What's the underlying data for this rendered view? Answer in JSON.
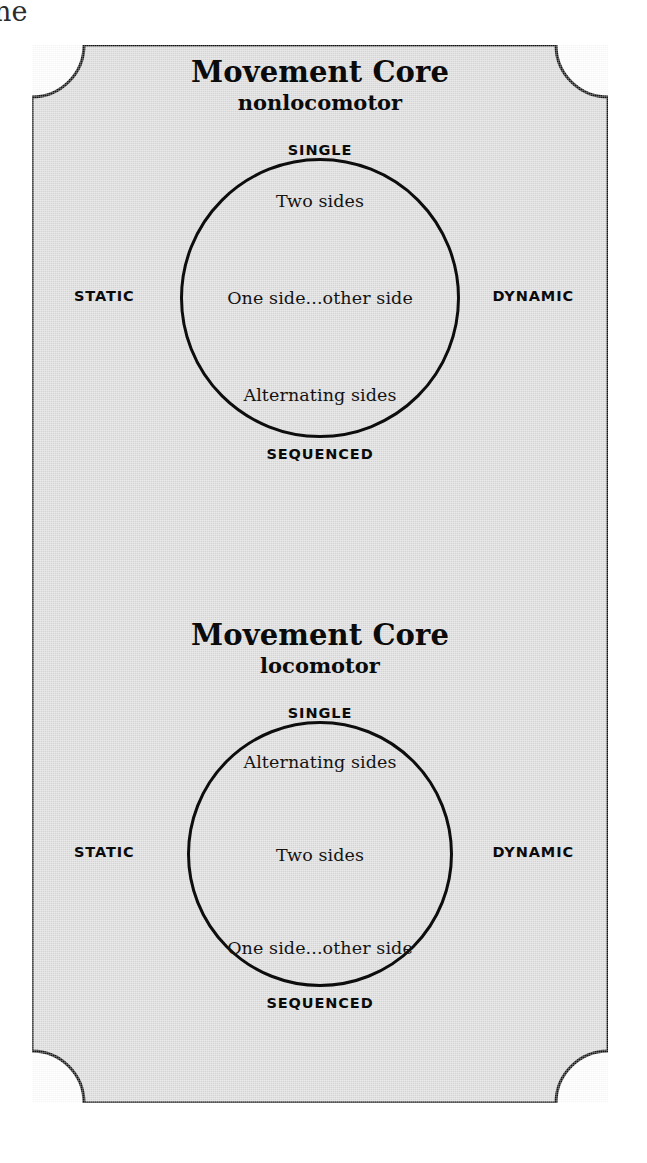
{
  "page": {
    "edge_text": "ne",
    "paper_color": "#dcdcdc",
    "ink_color": "#0d0d0d"
  },
  "diagrams": [
    {
      "id": "nonlocomotor",
      "title": "Movement Core",
      "subtitle": "nonlocomotor",
      "poles": {
        "top": "SINGLE",
        "bottom": "SEQUENCED",
        "left": "STATIC",
        "right": "DYNAMIC"
      },
      "circle_items": [
        "Two sides",
        "One side...other side",
        "Alternating sides"
      ]
    },
    {
      "id": "locomotor",
      "title": "Movement Core",
      "subtitle": "locomotor",
      "poles": {
        "top": "SINGLE",
        "bottom": "SEQUENCED",
        "left": "STATIC",
        "right": "DYNAMIC"
      },
      "circle_items": [
        "Alternating sides",
        "Two sides",
        "One side...other side"
      ]
    }
  ]
}
